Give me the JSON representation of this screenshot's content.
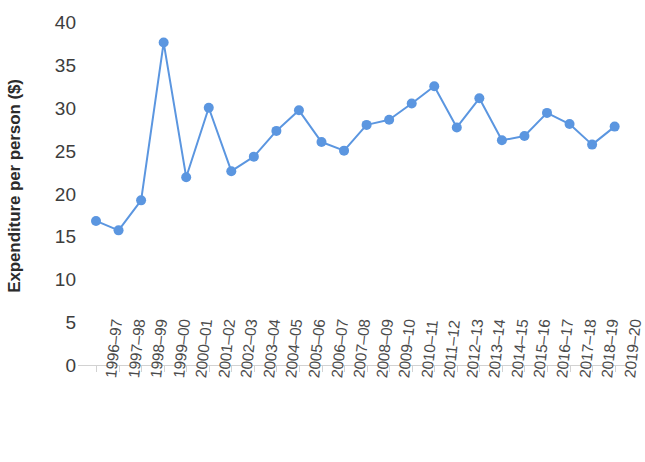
{
  "chart_data": {
    "type": "line",
    "title": "",
    "xlabel": "",
    "ylabel": "Expenditure per person ($)",
    "ylim": [
      0,
      40
    ],
    "ytick_values": [
      0,
      5,
      10,
      15,
      20,
      25,
      30,
      35,
      40
    ],
    "ytick_labels": [
      "0",
      "5",
      "10",
      "15",
      "20",
      "25",
      "30",
      "35",
      "40"
    ],
    "grid": false,
    "legend": false,
    "marker": "circle",
    "series_color": "#5B96E0",
    "categories": [
      "1996–97",
      "1997–98",
      "1998–99",
      "1999–00",
      "2000–01",
      "2001–02",
      "2002–03",
      "2003–04",
      "2004–05",
      "2005–06",
      "2006–07",
      "2007–08",
      "2008–09",
      "2009–10",
      "2010–11",
      "2011–12",
      "2012–13",
      "2013–14",
      "2014–15",
      "2015–16",
      "2016–17",
      "2017–18",
      "2018–19",
      "2019–20"
    ],
    "values": [
      16.8,
      15.7,
      19.2,
      37.6,
      21.9,
      30.0,
      22.6,
      24.3,
      27.3,
      29.7,
      26.0,
      25.0,
      28.0,
      28.6,
      30.5,
      32.5,
      27.7,
      31.1,
      26.2,
      26.7,
      29.4,
      28.1,
      25.7,
      27.8
    ]
  }
}
